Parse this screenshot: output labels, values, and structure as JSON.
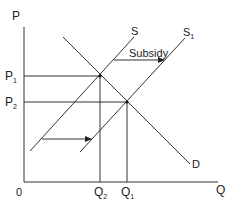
{
  "diagram": {
    "type": "supply-demand",
    "axes": {
      "y_label": "P",
      "x_label": "Q",
      "origin_label": "0"
    },
    "curves": {
      "supply_original": {
        "label": "S"
      },
      "supply_shifted": {
        "label": "S",
        "subscript": "1"
      },
      "demand": {
        "label": "D"
      }
    },
    "price_labels": [
      {
        "label": "P",
        "subscript": "1"
      },
      {
        "label": "P",
        "subscript": "2"
      }
    ],
    "quantity_labels": [
      {
        "label": "Q",
        "subscript": "2"
      },
      {
        "label": "Q",
        "subscript": "1"
      }
    ],
    "annotations": {
      "shift_arrow_label": "Subsidy"
    },
    "colors": {
      "line": "#333333",
      "text": "#222222",
      "background": "#ffffff"
    }
  }
}
